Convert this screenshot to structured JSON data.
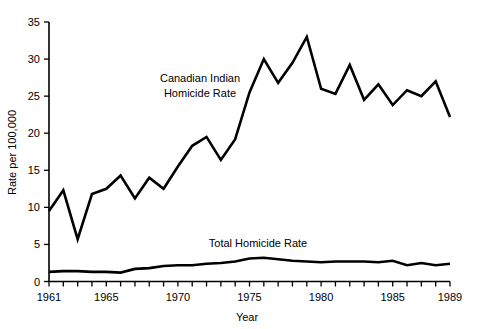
{
  "chart_data": {
    "type": "line",
    "title": "",
    "xlabel": "Year",
    "ylabel": "Rate per 100,000",
    "xlim": [
      1961,
      1989
    ],
    "ylim": [
      0,
      35
    ],
    "grid": false,
    "legend_position": "inline-annotation",
    "x": [
      1961,
      1962,
      1963,
      1964,
      1965,
      1966,
      1967,
      1968,
      1969,
      1970,
      1971,
      1972,
      1973,
      1974,
      1975,
      1976,
      1977,
      1978,
      1979,
      1980,
      1981,
      1982,
      1983,
      1984,
      1985,
      1986,
      1987,
      1988,
      1989
    ],
    "x_tick_labels": [
      "1961",
      "1965",
      "1970",
      "1975",
      "1980",
      "1985",
      "1989"
    ],
    "x_tick_values": [
      1961,
      1965,
      1970,
      1975,
      1980,
      1985,
      1989
    ],
    "y_tick_labels": [
      "0",
      "5",
      "10",
      "15",
      "20",
      "25",
      "30",
      "35"
    ],
    "y_tick_values": [
      0,
      5,
      10,
      15,
      20,
      25,
      30,
      35
    ],
    "series": [
      {
        "name": "Canadian Indian Homicide Rate",
        "annotation": "Canadian Indian\nHomicide Rate",
        "annotation_line1": "Canadian Indian",
        "annotation_line2": "Homicide Rate",
        "values": [
          9.5,
          12.3,
          5.7,
          11.8,
          12.5,
          14.3,
          11.2,
          14.0,
          12.5,
          15.5,
          18.3,
          19.5,
          16.4,
          19.2,
          25.5,
          30.0,
          26.8,
          29.5,
          33.0,
          26.0,
          25.3,
          29.2,
          24.5,
          26.6,
          23.8,
          25.8,
          25.0,
          27.0,
          22.2
        ]
      },
      {
        "name": "Total Homicide Rate",
        "annotation": "Total Homicide Rate",
        "annotation_line1": "Total Homicide Rate",
        "values": [
          1.3,
          1.4,
          1.4,
          1.3,
          1.3,
          1.2,
          1.7,
          1.8,
          2.1,
          2.2,
          2.2,
          2.4,
          2.5,
          2.7,
          3.1,
          3.2,
          3.0,
          2.8,
          2.7,
          2.6,
          2.7,
          2.7,
          2.7,
          2.6,
          2.8,
          2.2,
          2.5,
          2.2,
          2.4
        ]
      }
    ]
  },
  "axes": {
    "y_title": "Rate per 100,000",
    "x_title": "Year"
  }
}
